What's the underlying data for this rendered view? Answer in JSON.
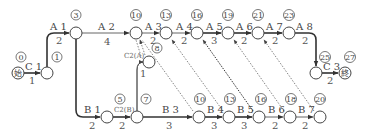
{
  "diagram": {
    "type": "arrow-network",
    "nodes": [
      {
        "id": "start",
        "label": "始",
        "time": "0"
      },
      {
        "id": "n1",
        "time": "1"
      },
      {
        "id": "n3",
        "time": "3"
      },
      {
        "id": "t10",
        "time": "10"
      },
      {
        "id": "t13",
        "time": "13"
      },
      {
        "id": "t16",
        "time": "16"
      },
      {
        "id": "t19",
        "time": "19"
      },
      {
        "id": "t21",
        "time": "21"
      },
      {
        "id": "t23",
        "time": "23"
      },
      {
        "id": "n8",
        "time": "8"
      },
      {
        "id": "b5",
        "time": "5"
      },
      {
        "id": "b7",
        "time": "7"
      },
      {
        "id": "b10",
        "time": "10"
      },
      {
        "id": "b13",
        "time": "13"
      },
      {
        "id": "b16",
        "time": "16"
      },
      {
        "id": "b18",
        "time": "18"
      },
      {
        "id": "b20",
        "time": "20"
      },
      {
        "id": "n25",
        "time": "25"
      },
      {
        "id": "end",
        "label": "終",
        "time": "27"
      }
    ],
    "activities": [
      {
        "id": "C1",
        "label": "C 1",
        "duration": "1",
        "from": "start",
        "to": "n1"
      },
      {
        "id": "A1",
        "label": "A 1",
        "duration": "2",
        "from": "n1",
        "to": "n3"
      },
      {
        "id": "A2",
        "label": "A 2",
        "duration": "4",
        "from": "n3",
        "to": "t10"
      },
      {
        "id": "A3",
        "label": "A 3",
        "duration": "2",
        "from": "t10",
        "to": "t13"
      },
      {
        "id": "A4",
        "label": "A 4",
        "duration": "2",
        "from": "t13",
        "to": "t16"
      },
      {
        "id": "A5",
        "label": "A 5",
        "duration": "3",
        "from": "t16",
        "to": "t19"
      },
      {
        "id": "A6",
        "label": "A 6",
        "duration": "2",
        "from": "t19",
        "to": "t21"
      },
      {
        "id": "A7",
        "label": "A 7",
        "duration": "2",
        "from": "t21",
        "to": "t23"
      },
      {
        "id": "A8",
        "label": "A 8",
        "duration": "2",
        "from": "t23",
        "to": "n25"
      },
      {
        "id": "B1",
        "label": "B 1",
        "duration": "2",
        "from": "n3",
        "to": "b5"
      },
      {
        "id": "C2B",
        "label": "C2(B)",
        "duration": "2",
        "from": "b5",
        "to": "b7"
      },
      {
        "id": "C2A",
        "label": "C2(A)",
        "duration": "1",
        "from": "b7",
        "to": "n8"
      },
      {
        "id": "B3",
        "label": "B 3",
        "duration": "3",
        "from": "b7",
        "to": "b10"
      },
      {
        "id": "B4",
        "label": "B 4",
        "duration": "3",
        "from": "b10",
        "to": "b13"
      },
      {
        "id": "B5",
        "label": "B 5",
        "duration": "3",
        "from": "b13",
        "to": "b16"
      },
      {
        "id": "B6",
        "label": "B 6",
        "duration": "2",
        "from": "b16",
        "to": "b18"
      },
      {
        "id": "B7",
        "label": "B 7",
        "duration": "2",
        "from": "b18",
        "to": "b20"
      },
      {
        "id": "C3",
        "label": "C 3",
        "duration": "2",
        "from": "n25",
        "to": "end"
      }
    ],
    "dummies": [
      {
        "from": "n8",
        "to": "t10"
      },
      {
        "from": "b10",
        "to": "t10"
      },
      {
        "from": "b13",
        "to": "t13"
      },
      {
        "from": "b16",
        "to": "t16"
      },
      {
        "from": "b18",
        "to": "t19"
      },
      {
        "from": "b20",
        "to": "t21"
      }
    ]
  }
}
